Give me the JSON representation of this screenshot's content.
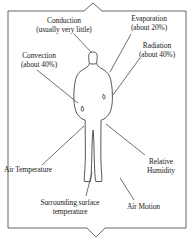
{
  "diagram": {
    "frame": {
      "stroke_color": "#555555",
      "top_notch": "upward-peak-brace",
      "bottom_notch": "downward-point-brace"
    },
    "figure": {
      "name": "human-body-silhouette",
      "outline_color": "#444444"
    },
    "labels": [
      {
        "id": "conduction",
        "text": "Conduction\n(usually very little)",
        "line1": "Conduction",
        "line2": "(usually very little)",
        "percent": "usually very little"
      },
      {
        "id": "evaporation",
        "text": "Evaporation\n(about 20%)",
        "line1": "Evaporation",
        "line2": "(about 20%)",
        "percent": "about 20%"
      },
      {
        "id": "radiation",
        "text": "Radiation\n(about 40%)",
        "line1": "Radiation",
        "line2": "(about 40%)",
        "percent": "about 40%"
      },
      {
        "id": "convection",
        "text": "Convection\n(about 40%)",
        "line1": "Convection",
        "line2": "(about 40%)",
        "percent": "about 40%"
      },
      {
        "id": "air-temperature",
        "text": "Air Temperature",
        "line1": "Air Temperature",
        "line2": "",
        "percent": ""
      },
      {
        "id": "relative-humidity",
        "text": "Relative\nHumidity",
        "line1": "Relative",
        "line2": "Humidity",
        "percent": ""
      },
      {
        "id": "surrounding-surface-temperature",
        "text": "Surrounding surface\ntemperature",
        "line1": "Surrounding surface",
        "line2": "temperature",
        "percent": ""
      },
      {
        "id": "air-motion",
        "text": "Air Motion",
        "line1": "Air Motion",
        "line2": "",
        "percent": ""
      }
    ]
  }
}
